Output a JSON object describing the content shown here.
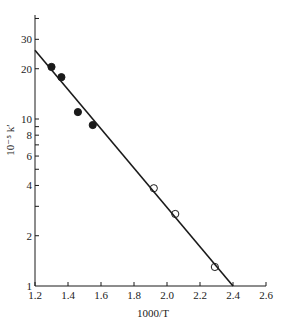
{
  "chart_data": {
    "type": "scatter",
    "title": "",
    "xlabel": "1000/T",
    "ylabel": "10⁻⁵ k′",
    "xscale": "linear",
    "yscale": "log",
    "xlim": [
      1.2,
      2.6
    ],
    "ylim": [
      1,
      42
    ],
    "x_ticks": [
      1.2,
      1.4,
      1.6,
      1.8,
      2.0,
      2.2,
      2.4,
      2.6
    ],
    "x_tick_labels": [
      "1.2",
      "1.4",
      "1.6",
      "1.8",
      "2.0",
      "2.2",
      "2.4",
      "2.6"
    ],
    "y_ticks_major_labeled": [
      1,
      2,
      4,
      6,
      8,
      10,
      20,
      30
    ],
    "y_tick_labels": [
      "1",
      "2",
      "4",
      "6",
      "8",
      "10",
      "20",
      "30"
    ],
    "y_ticks_minor": [
      3,
      5,
      7,
      9,
      40
    ],
    "grid": false,
    "legend": null,
    "series": [
      {
        "name": "filled points",
        "marker": "filled-circle",
        "x": [
          1.3,
          1.36,
          1.46,
          1.55
        ],
        "y": [
          20.5,
          17.8,
          11.0,
          9.2
        ]
      },
      {
        "name": "open points",
        "marker": "open-circle",
        "x": [
          1.92,
          2.05,
          2.29
        ],
        "y": [
          3.85,
          2.7,
          1.3
        ]
      },
      {
        "name": "fit line",
        "type": "line",
        "x": [
          1.2,
          2.4
        ],
        "y": [
          25.8,
          1.0
        ]
      }
    ]
  }
}
